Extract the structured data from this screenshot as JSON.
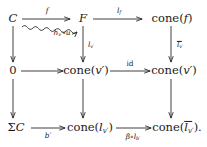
{
  "figure": {
    "type": "commutative-diagram",
    "rows": 3,
    "columns": 3,
    "trailing_punctuation": "."
  },
  "nodes": {
    "r1c1": "C",
    "r1c2": "F",
    "r1c3_fn": "cone",
    "r1c3_arg": "f",
    "r2c1": "0",
    "r2c2_fn": "cone",
    "r2c2_arg": "v",
    "r2c2_arg_prime": "′",
    "r2c3_fn": "cone",
    "r2c3_arg": "v",
    "r2c3_arg_prime": "′",
    "r3c1_sigma": "Σ",
    "r3c1_obj": "C",
    "r3c2_fn": "cone",
    "r3c2_arg": "l",
    "r3c2_sub": "v′",
    "r3c3_fn": "cone",
    "r3c3_arg": "l",
    "r3c3_sub": "v′",
    "r3c3_tail": ")."
  },
  "arrow_labels": {
    "top_left": "f",
    "top_right_main": "l",
    "top_right_sub": "f",
    "diagonal_h": "h",
    "diagonal_sub": "v′",
    "diagonal_comp": "∘u",
    "mid_vertical_main": "l",
    "mid_vertical_sub": "v′",
    "right_vertical_main": "l",
    "right_vertical_sub": "v′",
    "middle_row_right": "id",
    "bottom_left": "b′",
    "bottom_right_beta": "β∘l",
    "bottom_right_sub": "b′"
  },
  "style": {
    "stroke": "#2a2a2a",
    "background": "#ffffff",
    "text": "#1a1a1a"
  }
}
